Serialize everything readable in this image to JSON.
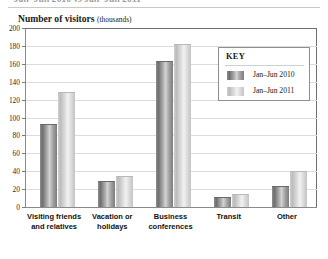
{
  "top_title": "Jan–Jun 2010 vs Jan–Jun 2011",
  "axis_title": {
    "main": "Number of visitors",
    "unit": "(thousands)"
  },
  "key": {
    "title": "KEY",
    "entries": [
      {
        "label": "Jan–Jun 2010",
        "swatch": "dark"
      },
      {
        "label": "Jan–Jun 2011",
        "swatch": "light"
      }
    ]
  },
  "yaxis": {
    "ticks": [
      "0",
      "20",
      "40",
      "60",
      "80",
      "100",
      "120",
      "140",
      "160",
      "180",
      "200"
    ]
  },
  "categories": [
    "Visiting friends\nand relatives",
    "Vacation or\nholidays",
    "Business\nconferences",
    "Transit",
    "Other"
  ],
  "chart_data": {
    "type": "bar",
    "title": "Jan–Jun 2010 vs Jan–Jun 2011",
    "ylabel": "Number of visitors (thousands)",
    "xlabel": "",
    "ylim": [
      0,
      200
    ],
    "ytick_step": 20,
    "grid": true,
    "legend_position": "inside-top-right",
    "legend_title": "KEY",
    "categories": [
      "Visiting friends and relatives",
      "Vacation or holidays",
      "Business conferences",
      "Transit",
      "Other"
    ],
    "series": [
      {
        "name": "Jan–Jun 2010",
        "color": "#8a8a8a",
        "values": [
          93,
          29,
          163,
          11,
          23
        ]
      },
      {
        "name": "Jan–Jun 2011",
        "color": "#d5d5d5",
        "values": [
          128,
          35,
          182,
          15,
          40
        ]
      }
    ]
  }
}
